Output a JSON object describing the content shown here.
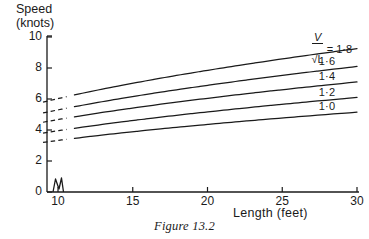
{
  "chart_data": {
    "type": "line",
    "title": "",
    "caption": "Figure 13.2",
    "xlabel": "Length (feet)",
    "ylabel_line1": "Speed",
    "ylabel_line2": "(knots)",
    "xlim": [
      9,
      30
    ],
    "ylim": [
      0,
      10
    ],
    "xticks": [
      10,
      15,
      20,
      25,
      30
    ],
    "xtick_labels": [
      "10",
      "15",
      "20",
      "25",
      "30"
    ],
    "yticks": [
      0,
      2,
      4,
      6,
      8,
      10
    ],
    "ytick_labels": [
      "0",
      "2",
      "4",
      "6",
      "8",
      "10"
    ],
    "grid": false,
    "axis_break": true,
    "legend_position": "right-inline",
    "ratio_label": {
      "numerator": "V",
      "denominator": "√L",
      "equals": "= 1·8"
    },
    "series": [
      {
        "name": "1·8",
        "label": "1·8",
        "ratio": 1.8,
        "x": [
          9,
          12,
          15,
          18,
          21,
          24,
          27,
          30
        ],
        "y": [
          5.8,
          6.6,
          7.25,
          7.8,
          8.25,
          8.65,
          8.95,
          9.25
        ]
      },
      {
        "name": "1·6",
        "label": "1·6",
        "ratio": 1.6,
        "x": [
          9,
          12,
          15,
          18,
          21,
          24,
          27,
          30
        ],
        "y": [
          5.1,
          5.8,
          6.35,
          6.8,
          7.2,
          7.55,
          7.85,
          8.1
        ]
      },
      {
        "name": "1·4",
        "label": "1·4",
        "ratio": 1.4,
        "x": [
          9,
          12,
          15,
          18,
          21,
          24,
          27,
          30
        ],
        "y": [
          4.5,
          5.1,
          5.55,
          5.95,
          6.3,
          6.6,
          6.85,
          7.1
        ]
      },
      {
        "name": "1·2",
        "label": "1·2",
        "ratio": 1.2,
        "x": [
          9,
          12,
          15,
          18,
          21,
          24,
          27,
          30
        ],
        "y": [
          3.8,
          4.35,
          4.75,
          5.1,
          5.4,
          5.65,
          5.9,
          6.1
        ]
      },
      {
        "name": "1·0",
        "label": "1·0",
        "ratio": 1.0,
        "x": [
          9,
          12,
          15,
          18,
          21,
          24,
          27,
          30
        ],
        "y": [
          3.2,
          3.65,
          4.0,
          4.3,
          4.55,
          4.75,
          4.95,
          5.15
        ]
      }
    ],
    "dashed_lead_until_x": 10.6,
    "line_color": "#1a1a1a",
    "axis_color": "#1a1a1a"
  }
}
